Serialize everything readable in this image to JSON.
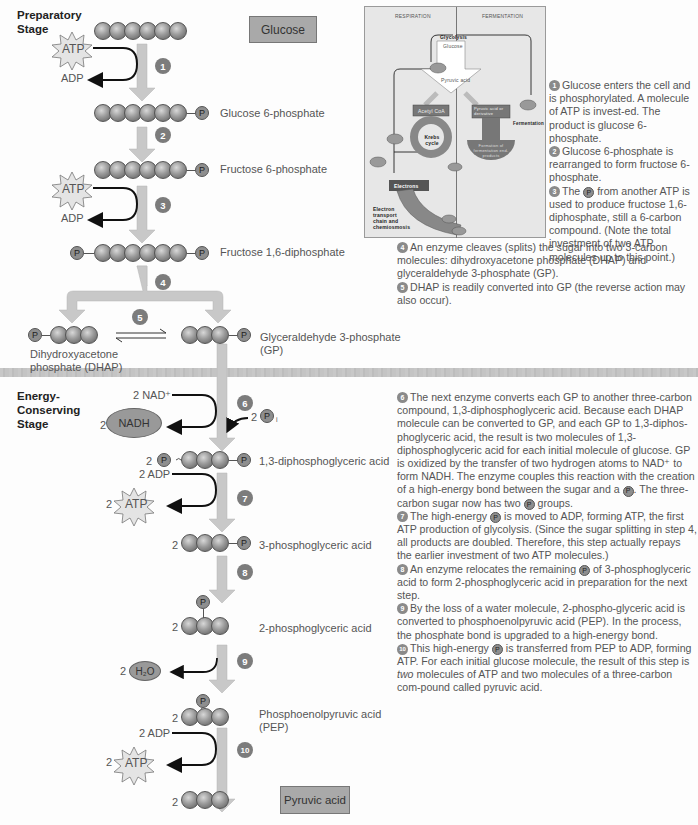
{
  "stages": {
    "preparatory": "Preparatory\nStage",
    "preparatory_line1": "Preparatory",
    "preparatory_line2": "Stage",
    "energy_line1": "Energy-",
    "energy_line2": "Conserving",
    "energy_line3": "Stage"
  },
  "boxes": {
    "start": "Glucose",
    "end": "Pyruvic acid"
  },
  "molecules": {
    "m1": "Glucose 6-phosphate",
    "m2": "Fructose 6-phosphate",
    "m3": "Fructose 1,6-diphosphate",
    "dhap_line1": "Dihydroxyacetone",
    "dhap_line2": "phosphate (DHAP)",
    "gp_line1": "Glyceraldehyde 3-phosphate",
    "gp_line2": "(GP)",
    "m6": "1,3-diphosphoglyceric acid",
    "m7": "3-phosphoglyceric acid",
    "m8": "2-phosphoglyceric acid",
    "pep_line1": "Phosphoenolpyruvic acid",
    "pep_line2": "(PEP)"
  },
  "cofactors": {
    "atp": "ATP",
    "adp": "ADP",
    "nad": "2 NAD⁺",
    "nadh": "NADH",
    "two": "2",
    "two_adp": "2 ADP",
    "h2o": "H₂O",
    "p": "P",
    "pi_sub": "i"
  },
  "steps": [
    "1",
    "2",
    "3",
    "4",
    "5",
    "6",
    "7",
    "8",
    "9",
    "10"
  ],
  "inset": {
    "respiration": "RESPIRATION",
    "fermentation": "FERMENTATION",
    "glycolysis": "Glycolysis",
    "glucose": "Glucose",
    "pyruvic": "Pyruvic acid",
    "acetyl": "Acetyl CoA",
    "krebs": "Krebs cycle",
    "nadh": "NADH",
    "atp": "ATP",
    "co2": "CO₂",
    "electrons": "Electrons",
    "etc_line1": "Electron",
    "etc_line2": "transport",
    "etc_line3": "chain and",
    "etc_line4": "chemiosmosis",
    "o2": "O₂",
    "h2o": "H₂O",
    "pyr_deriv": "Pyruvic acid or derivative",
    "ferm_label": "Fermentation",
    "ferm_products": "Formation of fermentation end-products",
    "n1": "1",
    "n2": "2",
    "n3": "3"
  },
  "descriptions": {
    "d1": "Glucose enters the cell and is phosphorylated.  A molecule of ATP is invest-ed.  The product is glucose 6-phosphate.",
    "d2": "Glucose 6-phosphate is rearranged to form fructose 6-phosphate.",
    "d3a": "The",
    "d3b": "from another ATP is used to produce fructose 1,6-diphosphate, still a 6-carbon compound. (Note the total investment of two ATP molecules up to this point.)",
    "d4": "An enzyme cleaves (splits) the sugar into two 3-carbon molecules: dihydroxyacetone phosphate (DHAP) and glyceraldehyde 3-phosphate (GP).",
    "d5": "DHAP is readily converted into GP (the reverse action may also occur).",
    "d6a": "The next enzyme converts each GP to another three-carbon compound, 1,3-diphosphoglyceric acid.  Because each DHAP molecule can be converted to GP, and each GP to 1,3-diphos-phoglyceric acid, the result is two molecules of 1,3-diphosphoglyceric acid for each initial molecule of glucose.  GP is oxidized by the transfer of two hydrogen atoms to NAD⁺ to form NADH.  The enzyme couples this reaction with the creation of a high-energy bond between the sugar and a",
    "d6b": ".  The three-carbon sugar now has two",
    "d6c": "groups.",
    "d7a": "The high-energy",
    "d7b": "is moved to ADP, forming ATP, the first ATP production of glycolysis.  (Since the sugar splitting in step 4, all products are doubled.  Therefore, this step actually repays the earlier investment of two ATP molecules.)",
    "d8a": "An enzyme relocates the remaining",
    "d8b": "of 3-phosphoglyceric acid to form 2-phosphoglyceric acid in preparation for the next step.",
    "d9": "By the loss of a water molecule, 2-phospho-glyceric acid is converted to phosphoenolpyruvic acid (PEP).  In the process, the phosphate bond is upgraded to a high-energy bond.",
    "d10a": "This high-energy",
    "d10b": "is transferred from PEP to ADP, forming ATP.  For each initial glucose molecule, the result of this step is",
    "d10c": "two",
    "d10d": "molecules of ATP and two molecules of a three-carbon com-pound called pyruvic acid."
  },
  "colors": {
    "arrow": "#c8c8c8",
    "ball": "#8f8f8f",
    "box": "#a9a9a9",
    "divider": "#c4c4c4"
  }
}
